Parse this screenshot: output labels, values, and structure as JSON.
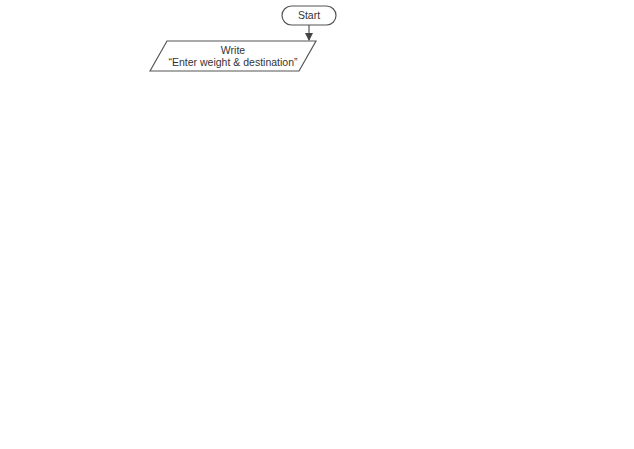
{
  "flowchart": {
    "start": "Start",
    "write1": {
      "line1": "Write",
      "line2": "“Enter weight & destination”"
    },
    "read": {
      "line1": "Read",
      "line2": "weight, dest"
    },
    "decision_dest": "dest == “I”",
    "branch_true": "True",
    "branch_false": "False",
    "international": {
      "d1": "weight ≤ 1",
      "d2": "weight ≤ 2",
      "d3": "weight ≤ 4",
      "p1": "cost ← weight * 0.010",
      "p2": "cost ← weight * 0.013",
      "p3": "cost ← weight * 0.015",
      "p4": "cost ← weight * 0.020"
    },
    "domestic": {
      "d1": "weight ≤ 1",
      "d2": "weight ≤ 2",
      "d3": "weight ≤ 4",
      "p1": "cost ← 10",
      "p2": "cost ← 20",
      "p3": "cost ← 50",
      "p4": "cost ← 60"
    },
    "write2": {
      "line1": "Write",
      "line2": "“Shipping cost:”, cost"
    },
    "end": "End",
    "colors": {
      "stroke": "#555555",
      "text": "#333333",
      "background": "#ffffff"
    }
  }
}
